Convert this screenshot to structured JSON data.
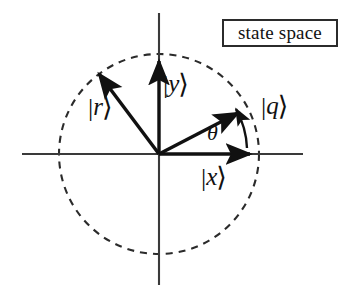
{
  "figure": {
    "title_box": {
      "text": "state space",
      "border_color": "#2b2b2b",
      "background": "#ffffff"
    },
    "canvas": {
      "width": 352,
      "height": 294,
      "background": "#ffffff"
    },
    "origin": {
      "x": 159,
      "y": 154
    },
    "unit_circle": {
      "style": "dashed",
      "radius": 100,
      "stroke": "#2b2b2b",
      "dash_pattern": "7 6"
    },
    "axes": {
      "stroke": "#3a3a3a",
      "horizontal": {
        "x1": 22,
        "y1": 154,
        "x2": 303,
        "y2": 154
      },
      "vertical": {
        "x1": 159,
        "y1": 13,
        "x2": 159,
        "y2": 285
      }
    },
    "vectors": [
      {
        "name": "r",
        "label": "|r⟩",
        "ket_letter": "r",
        "angle_deg": 127,
        "length": 103,
        "tip": {
          "x": 97,
          "y": 72
        },
        "stroke": "#111111"
      },
      {
        "name": "y",
        "label": "|y⟩",
        "ket_letter": "y",
        "angle_deg": 90,
        "length": 96,
        "tip": {
          "x": 159,
          "y": 58
        },
        "stroke": "#111111"
      },
      {
        "name": "q",
        "label": "|q⟩",
        "ket_letter": "q",
        "angle_deg": 28,
        "length": 92,
        "tip": {
          "x": 240,
          "y": 111
        },
        "stroke": "#111111"
      },
      {
        "name": "x",
        "label": "|x⟩",
        "ket_letter": "x",
        "angle_deg": 0,
        "length": 94,
        "tip": {
          "x": 253,
          "y": 154
        },
        "stroke": "#111111"
      }
    ],
    "angle_arc": {
      "symbol": "θ",
      "from_vector": "x",
      "to_vector": "q",
      "start_deg": 0,
      "end_deg": 28,
      "radius": 88,
      "stroke": "#111111"
    },
    "labels": {
      "r": {
        "bar": "|",
        "letter": "r",
        "angle": "⟩"
      },
      "y": {
        "bar": "|",
        "letter": "y",
        "angle": "⟩"
      },
      "q": {
        "bar": "|",
        "letter": "q",
        "angle": "⟩"
      },
      "x": {
        "bar": "|",
        "letter": "x",
        "angle": "⟩"
      },
      "theta": "θ"
    }
  }
}
